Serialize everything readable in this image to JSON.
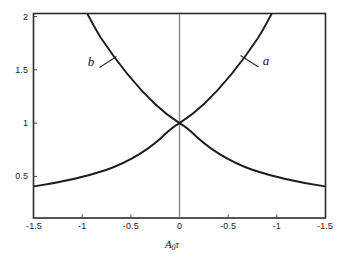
{
  "chart_data": {
    "type": "line",
    "title": "",
    "xlabel": "A₀τ",
    "ylabel": "",
    "grid": false,
    "legend_position": "inline-annotations",
    "xlim": [
      -1.5,
      1.5
    ],
    "ylim": [
      0.18,
      2.1
    ],
    "xticks": [
      -1.5,
      -1.0,
      -0.5,
      0,
      0.5,
      1.0,
      1.5
    ],
    "xticklabels": [
      "-1.5",
      "-1",
      "-0.5",
      "0",
      "-0.5",
      "-1",
      "-1.5"
    ],
    "yticks": [
      0.5,
      1.0,
      1.5,
      2.0
    ],
    "yticklabels": [
      "0.5",
      "1",
      "1.5",
      "2"
    ],
    "series": [
      {
        "name": "a",
        "label": "a",
        "description": "rising exponential curve, exp(x)",
        "color": "#1e1e1e",
        "x": [
          -1.5,
          -1.25,
          -1.0,
          -0.75,
          -0.5,
          -0.25,
          0,
          0.25,
          0.5,
          0.75,
          1.0,
          1.1
        ],
        "values": [
          0.35,
          0.4,
          0.45,
          0.52,
          0.61,
          0.78,
          1.0,
          1.28,
          1.46,
          1.65,
          1.9,
          2.1
        ]
      },
      {
        "name": "b",
        "label": "b",
        "description": "falling exponential curve, exp(-x)",
        "color": "#1e1e1e",
        "x": [
          -1.1,
          -1.0,
          -0.75,
          -0.5,
          -0.25,
          0,
          0.25,
          0.5,
          0.75,
          1.0,
          1.25,
          1.5
        ],
        "values": [
          2.1,
          1.9,
          1.65,
          1.46,
          1.28,
          1.0,
          0.78,
          0.61,
          0.52,
          0.45,
          0.4,
          0.35
        ]
      }
    ],
    "annotations": [
      {
        "text": "a",
        "x": 0.76,
        "y": 1.72,
        "leader": true
      },
      {
        "text": "b",
        "x": -0.73,
        "y": 1.72,
        "leader": true
      }
    ],
    "vertical_line": {
      "x": 0,
      "color": "#8a8a8a"
    },
    "frame_color": "#2b2b2b",
    "background": "#ffffff"
  }
}
